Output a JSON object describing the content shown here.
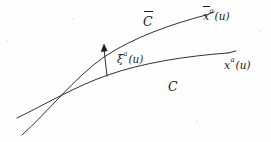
{
  "figure": {
    "background_color": "#fefefe",
    "ink_color": "#1a1a1a",
    "width": 271,
    "height": 142
  },
  "labels": {
    "upper_curve_endpoint": {
      "base": "x",
      "superscript": "a",
      "argument": "(u)",
      "has_overbar": true,
      "full_text": "x̄ᵃ(u)"
    },
    "lower_curve_endpoint": {
      "base": "x",
      "superscript": "a",
      "argument": "(u)",
      "has_overbar": false,
      "full_text": "xᵃ(u)"
    },
    "upper_curve_name": {
      "symbol": "C",
      "has_overbar": true,
      "full_text": "C̄"
    },
    "lower_curve_name": {
      "symbol": "C",
      "has_overbar": false,
      "full_text": "C"
    },
    "deviation_vector": {
      "base": "ξ",
      "superscript": "a",
      "argument": "(u)",
      "has_overbar": false,
      "full_text": "ξᵃ(u)"
    }
  },
  "geometry": {
    "upper_curve_path": "M 22,135 C 48,112 74,78 104,57 C 134,37 172,24 206,15",
    "lower_curve_path": "M 17,118 C 46,104 76,86 108,75 C 142,63 186,56 228,53",
    "upper_tick_path": "M 206,15 L 214,12",
    "lower_tick_path": "M 228,53 L 236,51",
    "arrow_shaft": "M 107,76 L 104,49",
    "arrow_head_points": "104,44 101.2,51.6 107.2,50.9",
    "stroke_width": 0.9
  }
}
